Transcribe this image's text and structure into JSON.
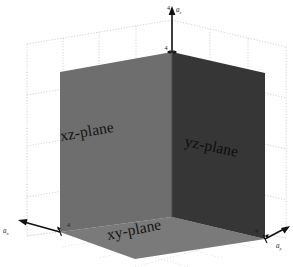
{
  "figure": {
    "background_color": "#ffffff",
    "width": 293,
    "height": 267
  },
  "planes": [
    {
      "id": "xz",
      "label": "xz-plane",
      "color": "#6e6e6e",
      "description": "left vertical panel"
    },
    {
      "id": "yz",
      "label": "yz-plane",
      "color": "#363636",
      "description": "right vertical panel"
    },
    {
      "id": "xy",
      "label": "xy-plane",
      "color": "#7a7a7a",
      "description": "bottom horizontal floor panel"
    }
  ],
  "axes": [
    {
      "id": "z",
      "label": "a",
      "subscript": "z",
      "tick_label": "4",
      "direction": "up"
    },
    {
      "id": "x",
      "label": "a",
      "subscript": "x",
      "tick_label": "4",
      "direction": "lower-left"
    },
    {
      "id": "y",
      "label": "a",
      "subscript": "y",
      "tick_label": "4",
      "direction": "lower-right"
    }
  ],
  "grid": {
    "color": "#c9c9c9",
    "style": "dotted",
    "visible": true
  },
  "colors": {
    "background": "#ffffff",
    "grid": "#c9c9c9",
    "axis": "#111111",
    "panel_xz": "#6e6e6e",
    "panel_yz": "#363636",
    "panel_xy": "#7a7a7a",
    "label_text": "#141414"
  }
}
